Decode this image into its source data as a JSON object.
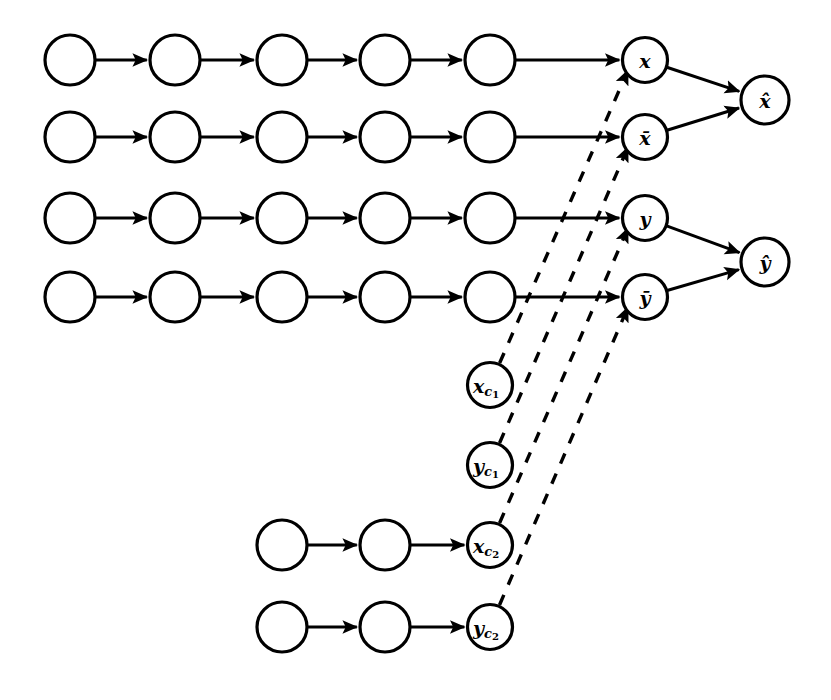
{
  "figure": {
    "background_color": "#ffffff",
    "stroke_color": "#000000",
    "width": 831,
    "height": 700
  },
  "style": {
    "node_radius_plain": 25,
    "node_radius_labeled": 22.5,
    "node_radius_hat": 24,
    "node_radius_context": 22.5,
    "solid_stroke_width": 3.0,
    "dashed_stroke_width": 3.4,
    "dash_pattern": "11 11"
  },
  "nodes": [
    {
      "id": "r1c1",
      "label": "",
      "cx": 70,
      "cy": 60,
      "r": 25,
      "row": "x-chain",
      "kind": "plain"
    },
    {
      "id": "r1c2",
      "label": "",
      "cx": 175,
      "cy": 60,
      "r": 25,
      "row": "x-chain",
      "kind": "plain"
    },
    {
      "id": "r1c3",
      "label": "",
      "cx": 282,
      "cy": 60,
      "r": 25,
      "row": "x-chain",
      "kind": "plain"
    },
    {
      "id": "r1c4",
      "label": "",
      "cx": 385,
      "cy": 60,
      "r": 25,
      "row": "x-chain",
      "kind": "plain"
    },
    {
      "id": "r1c5",
      "label": "",
      "cx": 490,
      "cy": 60,
      "r": 25,
      "row": "x-chain",
      "kind": "plain"
    },
    {
      "id": "x",
      "label": "x",
      "cx": 645,
      "cy": 60,
      "r": 22.5,
      "row": "x-chain",
      "kind": "labeled"
    },
    {
      "id": "r2c1",
      "label": "",
      "cx": 70,
      "cy": 137,
      "r": 25,
      "row": "xbar-chain",
      "kind": "plain"
    },
    {
      "id": "r2c2",
      "label": "",
      "cx": 175,
      "cy": 137,
      "r": 25,
      "row": "xbar-chain",
      "kind": "plain"
    },
    {
      "id": "r2c3",
      "label": "",
      "cx": 282,
      "cy": 137,
      "r": 25,
      "row": "xbar-chain",
      "kind": "plain"
    },
    {
      "id": "r2c4",
      "label": "",
      "cx": 385,
      "cy": 137,
      "r": 25,
      "row": "xbar-chain",
      "kind": "plain"
    },
    {
      "id": "r2c5",
      "label": "",
      "cx": 490,
      "cy": 137,
      "r": 25,
      "row": "xbar-chain",
      "kind": "plain"
    },
    {
      "id": "xbar",
      "label": "x̄",
      "cx": 645,
      "cy": 137,
      "r": 22.5,
      "row": "xbar-chain",
      "kind": "labeled"
    },
    {
      "id": "r3c1",
      "label": "",
      "cx": 70,
      "cy": 218,
      "r": 25,
      "row": "y-chain",
      "kind": "plain"
    },
    {
      "id": "r3c2",
      "label": "",
      "cx": 175,
      "cy": 218,
      "r": 25,
      "row": "y-chain",
      "kind": "plain"
    },
    {
      "id": "r3c3",
      "label": "",
      "cx": 282,
      "cy": 218,
      "r": 25,
      "row": "y-chain",
      "kind": "plain"
    },
    {
      "id": "r3c4",
      "label": "",
      "cx": 385,
      "cy": 218,
      "r": 25,
      "row": "y-chain",
      "kind": "plain"
    },
    {
      "id": "r3c5",
      "label": "",
      "cx": 490,
      "cy": 218,
      "r": 25,
      "row": "y-chain",
      "kind": "plain"
    },
    {
      "id": "y",
      "label": "y",
      "cx": 645,
      "cy": 218,
      "r": 22.5,
      "row": "y-chain",
      "kind": "labeled"
    },
    {
      "id": "r4c1",
      "label": "",
      "cx": 70,
      "cy": 297,
      "r": 25,
      "row": "ybar-chain",
      "kind": "plain"
    },
    {
      "id": "r4c2",
      "label": "",
      "cx": 175,
      "cy": 297,
      "r": 25,
      "row": "ybar-chain",
      "kind": "plain"
    },
    {
      "id": "r4c3",
      "label": "",
      "cx": 282,
      "cy": 297,
      "r": 25,
      "row": "ybar-chain",
      "kind": "plain"
    },
    {
      "id": "r4c4",
      "label": "",
      "cx": 385,
      "cy": 297,
      "r": 25,
      "row": "ybar-chain",
      "kind": "plain"
    },
    {
      "id": "r4c5",
      "label": "",
      "cx": 490,
      "cy": 297,
      "r": 25,
      "row": "ybar-chain",
      "kind": "plain"
    },
    {
      "id": "ybar",
      "label": "ȳ",
      "cx": 645,
      "cy": 297,
      "r": 22.5,
      "row": "ybar-chain",
      "kind": "labeled"
    },
    {
      "id": "xhat",
      "label": "x̂",
      "cx": 765,
      "cy": 100,
      "r": 24,
      "row": "output",
      "kind": "hat"
    },
    {
      "id": "yhat",
      "label": "ŷ",
      "cx": 765,
      "cy": 262,
      "r": 24,
      "row": "output",
      "kind": "hat"
    },
    {
      "id": "xc1",
      "label": "x",
      "sub": "c1",
      "cx": 490,
      "cy": 385,
      "r": 22.5,
      "row": "context-xc1",
      "kind": "context"
    },
    {
      "id": "yc1",
      "label": "y",
      "sub": "c1",
      "cx": 490,
      "cy": 465,
      "r": 22.5,
      "row": "context-yc1",
      "kind": "context"
    },
    {
      "id": "r7c3",
      "label": "",
      "cx": 282,
      "cy": 545,
      "r": 25,
      "row": "xc2-chain",
      "kind": "plain"
    },
    {
      "id": "r7c4",
      "label": "",
      "cx": 385,
      "cy": 545,
      "r": 25,
      "row": "xc2-chain",
      "kind": "plain"
    },
    {
      "id": "xc2",
      "label": "x",
      "sub": "c2",
      "cx": 490,
      "cy": 545,
      "r": 22.5,
      "row": "xc2-chain",
      "kind": "context"
    },
    {
      "id": "r8c3",
      "label": "",
      "cx": 282,
      "cy": 627,
      "r": 25,
      "row": "yc2-chain",
      "kind": "plain"
    },
    {
      "id": "r8c4",
      "label": "",
      "cx": 385,
      "cy": 627,
      "r": 25,
      "row": "yc2-chain",
      "kind": "plain"
    },
    {
      "id": "yc2",
      "label": "y",
      "sub": "c2",
      "cx": 490,
      "cy": 627,
      "r": 22.5,
      "row": "yc2-chain",
      "kind": "context"
    }
  ],
  "edges_solid": [
    {
      "from": "r1c1",
      "to": "r1c2"
    },
    {
      "from": "r1c2",
      "to": "r1c3"
    },
    {
      "from": "r1c3",
      "to": "r1c4"
    },
    {
      "from": "r1c4",
      "to": "r1c5"
    },
    {
      "from": "r1c5",
      "to": "x"
    },
    {
      "from": "r2c1",
      "to": "r2c2"
    },
    {
      "from": "r2c2",
      "to": "r2c3"
    },
    {
      "from": "r2c3",
      "to": "r2c4"
    },
    {
      "from": "r2c4",
      "to": "r2c5"
    },
    {
      "from": "r2c5",
      "to": "xbar"
    },
    {
      "from": "r3c1",
      "to": "r3c2"
    },
    {
      "from": "r3c2",
      "to": "r3c3"
    },
    {
      "from": "r3c3",
      "to": "r3c4"
    },
    {
      "from": "r3c4",
      "to": "r3c5"
    },
    {
      "from": "r3c5",
      "to": "y"
    },
    {
      "from": "r4c1",
      "to": "r4c2"
    },
    {
      "from": "r4c2",
      "to": "r4c3"
    },
    {
      "from": "r4c3",
      "to": "r4c4"
    },
    {
      "from": "r4c4",
      "to": "r4c5"
    },
    {
      "from": "r4c5",
      "to": "ybar"
    },
    {
      "from": "x",
      "to": "xhat"
    },
    {
      "from": "xbar",
      "to": "xhat"
    },
    {
      "from": "y",
      "to": "yhat"
    },
    {
      "from": "ybar",
      "to": "yhat"
    },
    {
      "from": "r7c3",
      "to": "r7c4"
    },
    {
      "from": "r7c4",
      "to": "xc2"
    },
    {
      "from": "r8c3",
      "to": "r8c4"
    },
    {
      "from": "r8c4",
      "to": "yc2"
    }
  ],
  "edges_dashed": [
    {
      "from": "xc1",
      "to": "x",
      "note": "context x c1 conditions x"
    },
    {
      "from": "yc1",
      "to": "xbar",
      "note": "context y c1 conditions x-bar"
    },
    {
      "from": "xc2",
      "to": "y",
      "note": "context x c2 conditions y"
    },
    {
      "from": "yc2",
      "to": "ybar",
      "note": "context y c2 conditions y-bar"
    }
  ]
}
